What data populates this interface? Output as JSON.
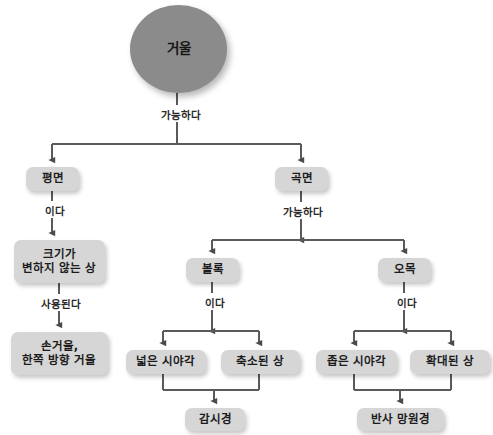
{
  "diagram": {
    "title_node": "거울",
    "type": "hierarchy-tree",
    "language": "ko",
    "colors": {
      "root_fill": "#8b8b8b",
      "node_fill": "#d6d6d6",
      "line": "#5a5a5a",
      "text": "#1c1c1c",
      "background": "#ffffff"
    },
    "nodes": [
      {
        "id": "mirror",
        "label": "거울",
        "shape": "ellipse",
        "x": 130,
        "y": 5,
        "w": 97,
        "h": 88
      },
      {
        "id": "flat",
        "label": "평면",
        "shape": "box",
        "x": 26,
        "y": 167,
        "w": 53,
        "h": 24
      },
      {
        "id": "curved",
        "label": "곡면",
        "shape": "box",
        "x": 275,
        "y": 167,
        "w": 53,
        "h": 24
      },
      {
        "id": "same-size",
        "label": "크기가\n변하지 않는 상",
        "shape": "box",
        "x": 14,
        "y": 240,
        "w": 91,
        "h": 43
      },
      {
        "id": "hand-mirror",
        "label": "손거울,\n한쪽 방향 거울",
        "shape": "box",
        "x": 11,
        "y": 332,
        "w": 97,
        "h": 43
      },
      {
        "id": "convex",
        "label": "볼록",
        "shape": "box",
        "x": 186,
        "y": 258,
        "w": 53,
        "h": 24
      },
      {
        "id": "concave",
        "label": "오목",
        "shape": "box",
        "x": 378,
        "y": 258,
        "w": 53,
        "h": 24
      },
      {
        "id": "wide-view",
        "label": "넓은 시야각",
        "shape": "box",
        "x": 126,
        "y": 350,
        "w": 80,
        "h": 24
      },
      {
        "id": "reduced-image",
        "label": "축소된 상",
        "shape": "box",
        "x": 221,
        "y": 350,
        "w": 79,
        "h": 24
      },
      {
        "id": "narrow-view",
        "label": "좁은 시야각",
        "shape": "box",
        "x": 316,
        "y": 350,
        "w": 81,
        "h": 24
      },
      {
        "id": "magnified",
        "label": "확대된 상",
        "shape": "box",
        "x": 410,
        "y": 350,
        "w": 80,
        "h": 24
      },
      {
        "id": "surveillance",
        "label": "감시경",
        "shape": "box",
        "x": 185,
        "y": 408,
        "w": 60,
        "h": 23
      },
      {
        "id": "telescope",
        "label": "반사 망원경",
        "shape": "box",
        "x": 357,
        "y": 408,
        "w": 87,
        "h": 23
      }
    ],
    "edge_labels": [
      {
        "id": "lbl-mirror-split",
        "text": "가능하다",
        "x": 146,
        "y": 107,
        "w": 66
      },
      {
        "id": "lbl-flat-isa",
        "text": "이다",
        "x": 32,
        "y": 203,
        "w": 41
      },
      {
        "id": "lbl-samesize-used",
        "text": "사용된다",
        "x": 26,
        "y": 296,
        "w": 66
      },
      {
        "id": "lbl-curved-split",
        "text": "가능하다",
        "x": 268,
        "y": 204,
        "w": 66
      },
      {
        "id": "lbl-convex-isa",
        "text": "이다",
        "x": 192,
        "y": 295,
        "w": 41
      },
      {
        "id": "lbl-concave-isa",
        "text": "이다",
        "x": 384,
        "y": 295,
        "w": 41
      }
    ],
    "connections": [
      {
        "from": "mirror",
        "to": [
          "flat",
          "curved"
        ],
        "label": "가능하다"
      },
      {
        "from": "flat",
        "to": [
          "same-size"
        ],
        "label": "이다"
      },
      {
        "from": "same-size",
        "to": [
          "hand-mirror"
        ],
        "label": "사용된다"
      },
      {
        "from": "curved",
        "to": [
          "convex",
          "concave"
        ],
        "label": "가능하다"
      },
      {
        "from": "convex",
        "to": [
          "wide-view",
          "reduced-image"
        ],
        "label": "이다"
      },
      {
        "from": "concave",
        "to": [
          "narrow-view",
          "magnified"
        ],
        "label": "이다"
      },
      {
        "from": [
          "wide-view",
          "reduced-image"
        ],
        "to": "surveillance",
        "label": ""
      },
      {
        "from": [
          "narrow-view",
          "magnified"
        ],
        "to": "telescope",
        "label": ""
      }
    ]
  }
}
